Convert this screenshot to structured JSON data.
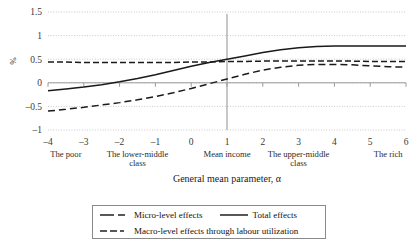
{
  "chart_data": {
    "type": "line",
    "title": "",
    "xlabel": "General mean parameter, α",
    "ylabel": "%",
    "xlim": [
      -4,
      6
    ],
    "ylim": [
      -1,
      1.5
    ],
    "grid": true,
    "x_ticks": [
      "-4",
      "-3",
      "-2",
      "-1",
      "0",
      "1",
      "2",
      "3",
      "4",
      "5",
      "6"
    ],
    "y_ticks": [
      "1.5",
      "1",
      "0.5",
      "0",
      "-0.5",
      "-1"
    ],
    "x_categories": [
      {
        "label": "The poor",
        "at": -3.5
      },
      {
        "label": "The lower-middle class",
        "at": -1.5
      },
      {
        "label": "Mean income",
        "at": 1.0
      },
      {
        "label": "The upper-middle class",
        "at": 3.0
      },
      {
        "label": "The rich",
        "at": 5.5
      }
    ],
    "reference_line": {
      "x": 1.0,
      "label": "Mean income"
    },
    "legend_position": "bottom",
    "x": [
      -4,
      -3.5,
      -3,
      -2.5,
      -2,
      -1.5,
      -1,
      -0.5,
      0,
      0.5,
      1,
      1.5,
      2,
      2.5,
      3,
      3.5,
      4,
      4.5,
      5,
      5.5,
      6
    ],
    "series": [
      {
        "name": "Micro-level effects",
        "style": "long-dash",
        "values": [
          -0.6,
          -0.56,
          -0.52,
          -0.47,
          -0.42,
          -0.36,
          -0.29,
          -0.21,
          -0.12,
          -0.02,
          0.08,
          0.18,
          0.27,
          0.33,
          0.37,
          0.39,
          0.39,
          0.38,
          0.36,
          0.34,
          0.33
        ]
      },
      {
        "name": "Total effects",
        "style": "solid",
        "values": [
          -0.17,
          -0.13,
          -0.09,
          -0.04,
          0.02,
          0.09,
          0.17,
          0.26,
          0.35,
          0.43,
          0.5,
          0.57,
          0.64,
          0.7,
          0.74,
          0.77,
          0.78,
          0.78,
          0.78,
          0.78,
          0.78
        ]
      },
      {
        "name": "Macro-level effects through labour utilization",
        "style": "dash-dot",
        "values": [
          0.44,
          0.44,
          0.43,
          0.43,
          0.43,
          0.43,
          0.43,
          0.43,
          0.44,
          0.44,
          0.45,
          0.45,
          0.46,
          0.46,
          0.46,
          0.46,
          0.46,
          0.46,
          0.45,
          0.45,
          0.45
        ]
      }
    ]
  },
  "legend": {
    "items": [
      {
        "label": "Micro-level effects",
        "style": "long-dash"
      },
      {
        "label": "Total effects",
        "style": "solid"
      },
      {
        "label": "Macro-level effects through labour utilization",
        "style": "dash-dot"
      }
    ]
  },
  "colors": {
    "line": "#1a1a1a",
    "grid": "#c9c9c9",
    "axis": "#9a9a9a",
    "text": "#2b2b2b"
  }
}
